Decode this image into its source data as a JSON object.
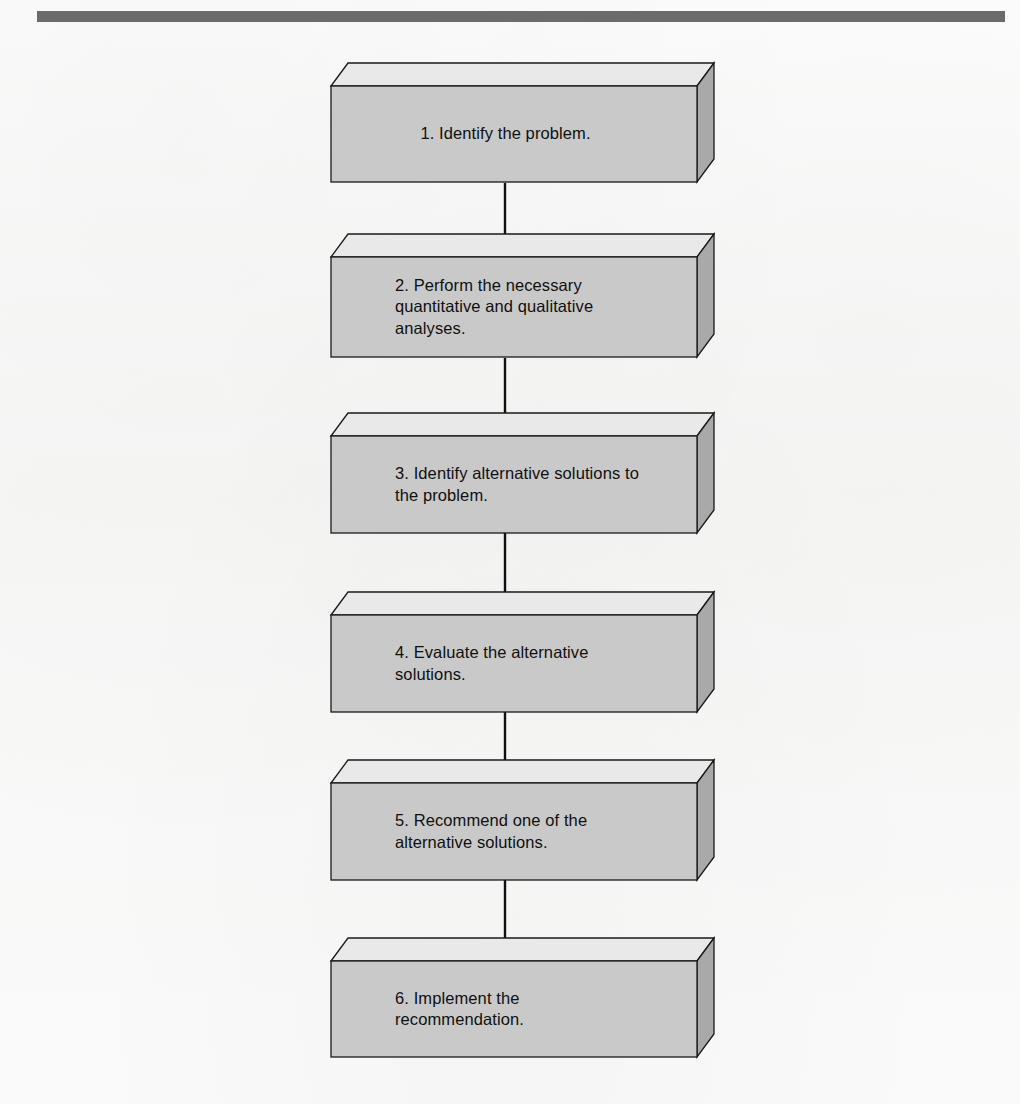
{
  "page": {
    "background_color": "#fbfbfb",
    "rule_color": "#6b6b6b"
  },
  "diagram": {
    "type": "flowchart",
    "orientation": "vertical",
    "title": "",
    "box_style": "3d-extruded-block",
    "colors": {
      "box_front": "#c9c9c9",
      "box_top": "#e9e9e9",
      "box_side": "#a9a9a9",
      "box_outline": "#1a1a1a",
      "arrow": "#101010",
      "text": "#101010"
    },
    "steps": [
      {
        "id": 1,
        "number": "1.",
        "label": "1. Identify the problem.",
        "lines": [
          "1. Identify the problem."
        ],
        "align": "center",
        "top": 63,
        "front_top": 87,
        "front_height": 96
      },
      {
        "id": 2,
        "number": "2.",
        "label": "2. Perform the necessary quantitative and qualitative analyses.",
        "lines": [
          "2. Perform the necessary",
          "quantitative and qualitative",
          "analyses."
        ],
        "align": "left",
        "top": 234,
        "front_top": 258,
        "front_height": 100
      },
      {
        "id": 3,
        "number": "3.",
        "label": "3. Identify alternative solutions to the problem.",
        "lines": [
          "3. Identify alternative solutions to",
          "the problem."
        ],
        "align": "left",
        "top": 413,
        "front_top": 436,
        "front_height": 97
      },
      {
        "id": 4,
        "number": "4.",
        "label": "4. Evaluate the alternative solutions.",
        "lines": [
          "4. Evaluate the alternative",
          "solutions."
        ],
        "align": "left",
        "top": 592,
        "front_top": 615,
        "front_height": 97
      },
      {
        "id": 5,
        "number": "5.",
        "label": "5. Recommend one of the alternative solutions.",
        "lines": [
          "5. Recommend one of the",
          "alternative solutions."
        ],
        "align": "left",
        "top": 760,
        "front_top": 783,
        "front_height": 97
      },
      {
        "id": 6,
        "number": "6.",
        "label": "6. Implement the recommendation.",
        "lines": [
          "6. Implement the",
          "recommendation."
        ],
        "align": "left",
        "top": 938,
        "front_top": 960,
        "front_height": 96
      }
    ],
    "connectors": [
      {
        "from": 1,
        "to": 2,
        "x": 505,
        "y_start": 183,
        "y_end": 258
      },
      {
        "from": 2,
        "to": 3,
        "x": 505,
        "y_start": 358,
        "y_end": 436
      },
      {
        "from": 3,
        "to": 4,
        "x": 505,
        "y_start": 533,
        "y_end": 615
      },
      {
        "from": 4,
        "to": 5,
        "x": 505,
        "y_start": 712,
        "y_end": 783
      },
      {
        "from": 5,
        "to": 6,
        "x": 505,
        "y_start": 880,
        "y_end": 960
      }
    ]
  }
}
